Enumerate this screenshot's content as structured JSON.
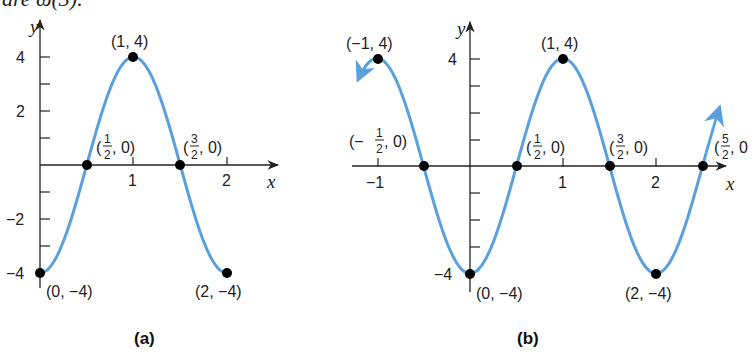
{
  "header_fragment": "are ω(3).",
  "colors": {
    "curve": "#5aa0dc",
    "axis": "#222222",
    "point": "#000000"
  },
  "chart_data": [
    {
      "type": "line",
      "title": "(a)",
      "xlabel": "x",
      "ylabel": "y",
      "xlim": [
        0,
        2.4
      ],
      "ylim": [
        -4,
        4.8
      ],
      "x_ticks": [
        "1",
        "2"
      ],
      "y_ticks": [
        "4",
        "2",
        "-2",
        "-4"
      ],
      "function": "y = -4cos(πx)",
      "x": [
        0,
        0.5,
        1,
        1.5,
        2
      ],
      "y": [
        -4,
        0,
        4,
        0,
        -4
      ],
      "points": [
        {
          "label": "(0, −4)"
        },
        {
          "label": "(1/2, 0)"
        },
        {
          "label": "(1, 4)"
        },
        {
          "label": "(3/2, 0)"
        },
        {
          "label": "(2, −4)"
        }
      ]
    },
    {
      "type": "line",
      "title": "(b)",
      "xlabel": "x",
      "ylabel": "y",
      "xlim": [
        -1.2,
        2.8
      ],
      "ylim": [
        -4,
        4.8
      ],
      "x_ticks": [
        "-1",
        "1",
        "2"
      ],
      "y_ticks": [
        "4",
        "-4"
      ],
      "function": "y = -4cos(πx)",
      "x": [
        -1,
        -0.5,
        0,
        0.5,
        1,
        1.5,
        2,
        2.5
      ],
      "y": [
        4,
        0,
        -4,
        0,
        4,
        0,
        -4,
        0
      ],
      "points": [
        {
          "label": "(−1, 4)"
        },
        {
          "label": "(−1/2, 0)"
        },
        {
          "label": "(0, −4)"
        },
        {
          "label": "(1/2, 0)"
        },
        {
          "label": "(1, 4)"
        },
        {
          "label": "(3/2, 0)"
        },
        {
          "label": "(2, −4)"
        },
        {
          "label": "(5/2, 0)"
        }
      ],
      "arrows": "both ends"
    }
  ],
  "a": {
    "caption": "(a)",
    "xlabel": "x",
    "ylabel": "y",
    "ticks": {
      "x1": "1",
      "x2": "2",
      "y4": "4",
      "y2": "2",
      "yn2": "−2",
      "yn4": "−4"
    },
    "labels": {
      "p_max": "(1, 4)",
      "p_start": "(0, −4)",
      "p_end": "(2, −4)",
      "z1_open": "(",
      "z1_num": "1",
      "z1_den": "2",
      "z1_close": ", 0)",
      "z2_open": "(",
      "z2_num": "3",
      "z2_den": "2",
      "z2_close": ", 0)"
    }
  },
  "b": {
    "caption": "(b)",
    "xlabel": "x",
    "ylabel": "y",
    "ticks": {
      "xn1": "−1",
      "x1": "1",
      "x2": "2",
      "y4": "4",
      "yn4": "−4"
    },
    "labels": {
      "p_lmax": "(−1, 4)",
      "p_max": "(1, 4)",
      "p_min0": "(0, −4)",
      "p_min2": "(2, −4)",
      "zn_open": "(−",
      "zn_num": "1",
      "zn_den": "2",
      "zn_close": ", 0)",
      "z1_open": "(",
      "z1_num": "1",
      "z1_den": "2",
      "z1_close": ", 0)",
      "z3_open": "(",
      "z3_num": "3",
      "z3_den": "2",
      "z3_close": ", 0)",
      "z5_open": "(",
      "z5_num": "5",
      "z5_den": "2",
      "z5_close": ", 0"
    }
  }
}
